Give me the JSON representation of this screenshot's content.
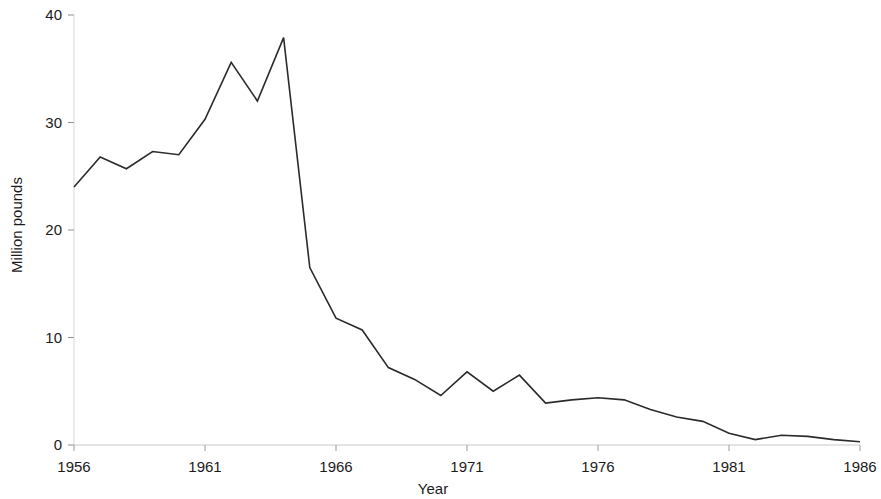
{
  "chart_data": {
    "type": "line",
    "title": "",
    "xlabel": "Year",
    "ylabel": "Million pounds",
    "xlim": [
      1956,
      1986
    ],
    "ylim": [
      0,
      40
    ],
    "xticks": [
      1956,
      1961,
      1966,
      1971,
      1976,
      1981,
      1986
    ],
    "xtick_labels": [
      "1956",
      "1961",
      "1966",
      "1971",
      "1976",
      "1981",
      "1986"
    ],
    "yticks": [
      0,
      10,
      20,
      30,
      40
    ],
    "ytick_labels": [
      "0",
      "10",
      "20",
      "30",
      "40"
    ],
    "grid": false,
    "legend": "none",
    "line_color": "#2b2b2b",
    "line_width": 1.6,
    "x": [
      1956,
      1957,
      1958,
      1959,
      1960,
      1961,
      1962,
      1963,
      1964,
      1965,
      1966,
      1967,
      1968,
      1969,
      1970,
      1971,
      1972,
      1973,
      1974,
      1975,
      1976,
      1977,
      1978,
      1979,
      1980,
      1981,
      1982,
      1983,
      1984,
      1985,
      1986
    ],
    "values": [
      24.0,
      26.8,
      25.7,
      27.3,
      27.0,
      30.3,
      35.6,
      32.0,
      37.9,
      16.5,
      11.8,
      10.7,
      7.2,
      6.1,
      4.6,
      6.8,
      5.0,
      6.5,
      3.9,
      4.2,
      4.4,
      4.2,
      3.3,
      2.6,
      2.2,
      1.1,
      0.5,
      0.9,
      0.8,
      0.5,
      0.3
    ],
    "series": [
      {
        "name": "Million pounds",
        "values": [
          24.0,
          26.8,
          25.7,
          27.3,
          27.0,
          30.3,
          35.6,
          32.0,
          37.9,
          16.5,
          11.8,
          10.7,
          7.2,
          6.1,
          4.6,
          6.8,
          5.0,
          6.5,
          3.9,
          4.2,
          4.4,
          4.2,
          3.3,
          2.6,
          2.2,
          1.1,
          0.5,
          0.9,
          0.8,
          0.5,
          0.3
        ]
      }
    ]
  },
  "axes": {
    "x_title": "Year",
    "y_title": "Million pounds"
  }
}
